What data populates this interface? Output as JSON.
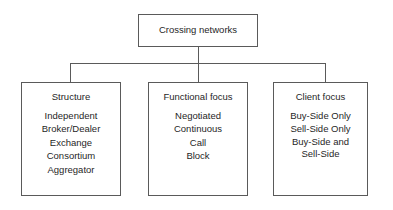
{
  "diagram": {
    "type": "hierarchy-tree",
    "background_color": "#ffffff",
    "border_color": "#5a5a5a",
    "text_color": "#1f1f1f",
    "root": {
      "label": "Crossing networks"
    },
    "children": [
      {
        "title": "Structure",
        "items": [
          "Independent",
          "Broker/Dealer",
          "Exchange",
          "Consortium",
          "Aggregator"
        ]
      },
      {
        "title": "Functional focus",
        "items": [
          "Negotiated",
          "Continuous",
          "Call",
          "Block"
        ]
      },
      {
        "title": "Client focus",
        "items": [
          "Buy-Side Only",
          "Sell-Side Only",
          "Buy-Side and Sell-Side"
        ]
      }
    ]
  }
}
